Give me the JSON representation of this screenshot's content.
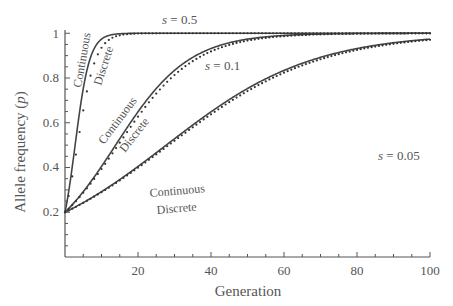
{
  "chart_data": {
    "type": "line",
    "title": "",
    "xlabel": "Generation",
    "ylabel": "Allele frequency (p)",
    "xlim": [
      0,
      100
    ],
    "ylim": [
      0,
      1
    ],
    "x_ticks": [
      20,
      40,
      60,
      80,
      100
    ],
    "y_ticks": [
      0.2,
      0.4,
      0.6,
      0.8,
      1
    ],
    "y_tick_labels": [
      "0.2",
      "0.4",
      "0.6",
      "0.8",
      "1"
    ],
    "x_tick_labels": [
      "20",
      "40",
      "60",
      "80",
      "100"
    ],
    "grid": false,
    "legend": "inline labels",
    "initial_p": 0.2,
    "series": [
      {
        "name": "s = 0.5 Continuous",
        "s": 0.5,
        "model": "continuous",
        "style": "solid",
        "x": [
          0,
          2,
          4,
          6,
          8,
          10,
          15,
          20,
          100
        ],
        "values": [
          0.2,
          0.4,
          0.65,
          0.83,
          0.93,
          0.97,
          0.998,
          1.0,
          1.0
        ]
      },
      {
        "name": "s = 0.5 Discrete",
        "s": 0.5,
        "model": "discrete",
        "style": "dotted",
        "x": [
          0,
          2,
          4,
          6,
          8,
          10,
          15,
          20,
          100
        ],
        "values": [
          0.2,
          0.36,
          0.56,
          0.74,
          0.86,
          0.93,
          0.99,
          1.0,
          1.0
        ]
      },
      {
        "name": "s = 0.1 Continuous",
        "s": 0.1,
        "model": "continuous",
        "style": "solid",
        "x": [
          0,
          10,
          20,
          30,
          40,
          50,
          60,
          80,
          100
        ],
        "values": [
          0.2,
          0.4,
          0.65,
          0.83,
          0.93,
          0.97,
          0.99,
          1.0,
          1.0
        ]
      },
      {
        "name": "s = 0.1 Discrete",
        "s": 0.1,
        "model": "discrete",
        "style": "dotted",
        "x": [
          0,
          10,
          20,
          30,
          40,
          50,
          60,
          80,
          100
        ],
        "values": [
          0.2,
          0.39,
          0.63,
          0.81,
          0.92,
          0.97,
          0.99,
          1.0,
          1.0
        ]
      },
      {
        "name": "s = 0.05 Continuous",
        "s": 0.05,
        "model": "continuous",
        "style": "solid",
        "x": [
          0,
          20,
          40,
          60,
          80,
          100
        ],
        "values": [
          0.2,
          0.23,
          0.27,
          0.31,
          0.36,
          0.41
        ]
      },
      {
        "name": "s = 0.05 Discrete",
        "s": 0.05,
        "model": "discrete",
        "style": "dotted",
        "x": [
          0,
          20,
          40,
          60,
          80,
          100
        ],
        "values": [
          0.2,
          0.23,
          0.27,
          0.31,
          0.36,
          0.41
        ]
      }
    ],
    "annotations": [
      {
        "text": "s = 0.5",
        "near": "top s=0.5 line"
      },
      {
        "text": "s = 0.1",
        "near": "s=0.1 curve"
      },
      {
        "text": "s = 0.05",
        "near": "s=0.05 line end"
      },
      {
        "text": "Continuous",
        "near": "s=0.5 solid"
      },
      {
        "text": "Discrete",
        "near": "s=0.5 dotted"
      },
      {
        "text": "Continuous",
        "near": "s=0.1 solid"
      },
      {
        "text": "Discrete",
        "near": "s=0.1 dotted"
      },
      {
        "text": "Continuous",
        "near": "s=0.05 solid"
      },
      {
        "text": "Discrete",
        "near": "s=0.05 dotted"
      }
    ]
  },
  "labels": {
    "xlabel": "Generation",
    "ylabel_main": "Allele frequency (",
    "ylabel_var": "p",
    "ylabel_end": ")",
    "s05": {
      "var": "s",
      "eq": " = 0.5"
    },
    "s01": {
      "var": "s",
      "eq": " = 0.1"
    },
    "s005": {
      "var": "s",
      "eq": " = 0.05"
    },
    "continuous": "Continuous",
    "discrete": "Discrete"
  }
}
